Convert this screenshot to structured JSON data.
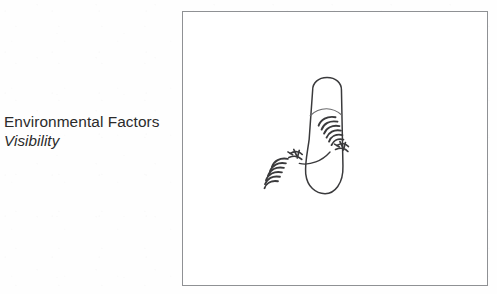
{
  "figure": {
    "caption": {
      "title": "Environmental Factors",
      "subtitle": "Visibility"
    },
    "panel": {
      "border_color": "#8f9194",
      "background_color": "#ffffff",
      "left": 182,
      "top": 11,
      "width": 306,
      "height": 275
    },
    "illustration": {
      "type": "line-drawing",
      "description": "Top-down outline of a rounded vehicle body with two radiating wave emanations",
      "stroke_color": "#3a3a3c",
      "parts": [
        {
          "name": "vehicle-body-outline",
          "shape": "rounded-capsule"
        },
        {
          "name": "windshield-line",
          "shape": "shallow-arc"
        },
        {
          "name": "wave-emanation-right",
          "shape": "stacked-arcs",
          "arc_count": 6
        },
        {
          "name": "wave-emitter-right",
          "shape": "knot-cluster"
        },
        {
          "name": "wave-emanation-left",
          "shape": "stacked-arcs",
          "arc_count": 6
        },
        {
          "name": "wave-emitter-left",
          "shape": "knot-cluster"
        },
        {
          "name": "connector-line",
          "shape": "curve"
        }
      ]
    }
  }
}
